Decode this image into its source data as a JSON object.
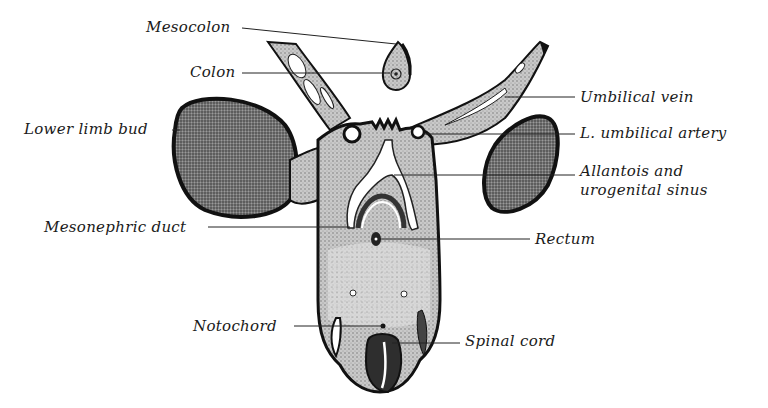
{
  "figure": {
    "type": "anatomical cross-section diagram",
    "background": "#ffffff",
    "ink_color": "#1a1a1a",
    "tissue_fill": "#b8b8b8",
    "dark_fill": "#6e6e6e"
  },
  "labels": {
    "mesocolon": "Mesocolon",
    "colon": "Colon",
    "lower_limb_bud": "Lower limb bud",
    "mesonephric_duct": "Mesonephric duct",
    "notochord": "Notochord",
    "umbilical_vein": "Umbilical vein",
    "l_umbilical_artery": "L. umbilical artery",
    "allantois_line1": "Allantois and",
    "allantois_line2": "urogenital sinus",
    "rectum": "Rectum",
    "spinal_cord": "Spinal cord"
  }
}
